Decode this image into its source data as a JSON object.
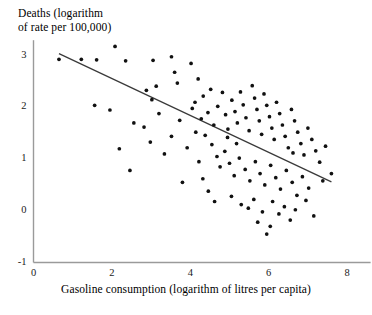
{
  "chart_data": {
    "type": "scatter",
    "title": "",
    "ylabel": "Deaths (logarithm\nof rate per 100,000)",
    "ylabel_line1": "Deaths (logarithm",
    "ylabel_line2": "of rate per 100,000)",
    "xlabel": "Gasoline consumption (logarithm of litres per capita)",
    "xlim": [
      0,
      8.6
    ],
    "ylim": [
      -1,
      3.3
    ],
    "xticks": [
      0,
      2,
      4,
      6,
      8
    ],
    "xtick_labels": [
      "0",
      "2",
      "4",
      "6",
      "8"
    ],
    "yticks": [
      -1,
      0,
      1,
      2,
      3
    ],
    "ytick_labels": [
      "-1",
      "0",
      "1",
      "2",
      "3"
    ],
    "grid": false,
    "legend": "none",
    "marker_color": "#111111",
    "line_color": "#3a3a3a",
    "axis_color": "#9a9a9a",
    "trendline": {
      "name": "regression line",
      "x": [
        0.65,
        7.6
      ],
      "y": [
        3.04,
        0.56
      ]
    },
    "series": [
      {
        "name": "countries",
        "points": [
          [
            0.65,
            2.93
          ],
          [
            1.22,
            2.93
          ],
          [
            1.61,
            2.92
          ],
          [
            1.56,
            2.04
          ],
          [
            2.08,
            3.18
          ],
          [
            2.35,
            2.9
          ],
          [
            2.19,
            1.2
          ],
          [
            3.05,
            2.91
          ],
          [
            3.52,
            2.98
          ],
          [
            3.6,
            2.68
          ],
          [
            3.13,
            2.41
          ],
          [
            2.88,
            2.33
          ],
          [
            3.02,
            2.15
          ],
          [
            3.67,
            2.47
          ],
          [
            3.73,
            1.75
          ],
          [
            3.52,
            1.44
          ],
          [
            4.02,
            2.85
          ],
          [
            4.2,
            2.55
          ],
          [
            4.05,
            1.98
          ],
          [
            4.14,
            1.52
          ],
          [
            1.95,
            1.95
          ],
          [
            2.56,
            1.7
          ],
          [
            2.82,
            1.62
          ],
          [
            2.98,
            1.33
          ],
          [
            3.2,
            1.88
          ],
          [
            3.34,
            1.1
          ],
          [
            2.46,
            0.78
          ],
          [
            3.92,
            1.22
          ],
          [
            4.33,
            2.22
          ],
          [
            4.45,
            1.9
          ],
          [
            4.52,
            2.35
          ],
          [
            4.6,
            1.66
          ],
          [
            4.12,
            2.1
          ],
          [
            4.28,
            1.78
          ],
          [
            4.38,
            1.46
          ],
          [
            4.7,
            2.02
          ],
          [
            4.82,
            2.29
          ],
          [
            4.9,
            1.86
          ],
          [
            4.96,
            1.58
          ],
          [
            5.06,
            2.14
          ],
          [
            5.14,
            1.92
          ],
          [
            5.2,
            1.7
          ],
          [
            5.28,
            2.3
          ],
          [
            5.35,
            2.05
          ],
          [
            5.42,
            1.8
          ],
          [
            5.5,
            1.55
          ],
          [
            5.58,
            2.42
          ],
          [
            5.64,
            2.18
          ],
          [
            5.7,
            1.96
          ],
          [
            5.76,
            1.74
          ],
          [
            5.82,
            1.48
          ],
          [
            5.88,
            2.26
          ],
          [
            5.95,
            2.04
          ],
          [
            6.02,
            1.82
          ],
          [
            6.08,
            1.6
          ],
          [
            6.14,
            1.38
          ],
          [
            6.2,
            2.1
          ],
          [
            6.28,
            1.88
          ],
          [
            6.35,
            1.66
          ],
          [
            6.42,
            1.44
          ],
          [
            6.5,
            1.22
          ],
          [
            6.58,
            1.96
          ],
          [
            6.66,
            1.74
          ],
          [
            6.74,
            1.52
          ],
          [
            6.82,
            1.3
          ],
          [
            6.9,
            1.08
          ],
          [
            7.0,
            1.6
          ],
          [
            7.1,
            1.38
          ],
          [
            7.2,
            1.16
          ],
          [
            7.3,
            0.94
          ],
          [
            7.45,
            1.25
          ],
          [
            7.6,
            0.72
          ],
          [
            4.55,
            1.28
          ],
          [
            4.68,
            1.05
          ],
          [
            4.76,
            0.85
          ],
          [
            4.88,
            1.15
          ],
          [
            5.0,
            0.92
          ],
          [
            5.12,
            0.68
          ],
          [
            5.25,
            1.02
          ],
          [
            5.4,
            0.8
          ],
          [
            5.52,
            0.58
          ],
          [
            5.66,
            0.95
          ],
          [
            5.78,
            0.72
          ],
          [
            5.9,
            0.5
          ],
          [
            6.05,
            0.88
          ],
          [
            6.18,
            0.64
          ],
          [
            6.3,
            0.42
          ],
          [
            6.45,
            0.78
          ],
          [
            6.6,
            0.55
          ],
          [
            6.72,
            0.3
          ],
          [
            6.86,
            0.66
          ],
          [
            7.02,
            0.44
          ],
          [
            4.32,
            0.62
          ],
          [
            4.46,
            0.38
          ],
          [
            5.05,
            0.28
          ],
          [
            5.3,
            0.12
          ],
          [
            5.48,
            0.05
          ],
          [
            5.62,
            0.22
          ],
          [
            5.84,
            -0.02
          ],
          [
            6.1,
            0.18
          ],
          [
            6.26,
            -0.06
          ],
          [
            6.4,
            0.08
          ],
          [
            6.55,
            -0.18
          ],
          [
            5.95,
            -0.45
          ],
          [
            6.68,
            0.02
          ],
          [
            6.95,
            0.2
          ],
          [
            7.15,
            -0.1
          ],
          [
            4.62,
            0.18
          ],
          [
            3.8,
            0.55
          ],
          [
            4.95,
            1.42
          ],
          [
            5.18,
            1.3
          ],
          [
            6.62,
            1.12
          ],
          [
            7.38,
            0.58
          ],
          [
            5.72,
            -0.22
          ],
          [
            6.04,
            -0.3
          ],
          [
            4.22,
            0.95
          ]
        ]
      }
    ]
  }
}
